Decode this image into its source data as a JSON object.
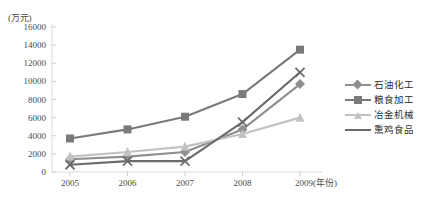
{
  "chart_data": {
    "type": "line",
    "title": "",
    "subtitle": "",
    "xlabel": "(年份)",
    "ylabel": "(万元)",
    "unit_label": "(万元)",
    "x_axis_suffix": "(年份)",
    "categories": [
      "2005",
      "2006",
      "2007",
      "2008",
      "2009"
    ],
    "x": [
      2005,
      2006,
      2007,
      2008,
      2009
    ],
    "ylim": [
      0,
      16000
    ],
    "ytick_step": 2000,
    "yticks": [
      "16000",
      "14000",
      "12000",
      "10000",
      "8000",
      "6000",
      "4000",
      "2000",
      "0"
    ],
    "ytick_values": [
      16000,
      14000,
      12000,
      10000,
      8000,
      6000,
      4000,
      2000,
      0
    ],
    "grid": false,
    "legend_position": "right",
    "series": [
      {
        "name": "石油化工",
        "marker": "diamond",
        "color": "#8f8f8f",
        "values": [
          1400,
          1700,
          2200,
          4700,
          9700
        ]
      },
      {
        "name": "粮食加工",
        "marker": "square",
        "color": "#7a7a7a",
        "values": [
          3700,
          4700,
          6100,
          8600,
          13500
        ]
      },
      {
        "name": "冶金机械",
        "marker": "triangle",
        "color": "#c2c2c2",
        "values": [
          1700,
          2200,
          2800,
          4200,
          6000
        ]
      },
      {
        "name": "熏鸡食品",
        "marker": "cross",
        "color": "#6b6b6b",
        "values": [
          800,
          1200,
          1200,
          5500,
          11000
        ]
      }
    ]
  },
  "axis": {
    "axis_color": "#d9d9d9",
    "tick_color": "#cfcfcf",
    "text_color": "#4a4a4a"
  }
}
